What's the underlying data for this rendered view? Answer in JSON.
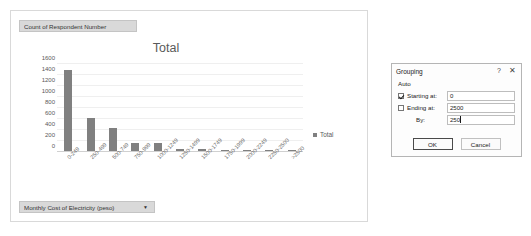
{
  "chart_panel": {
    "legend_field_button": {
      "label": "Count of Respondent Number",
      "arrow": ""
    },
    "axis_field_button": {
      "label": "Monthly Cost of Electricity (peso)",
      "arrow": "▼"
    },
    "legend": {
      "series_label": "Total",
      "swatch_color": "#808080"
    }
  },
  "chart_data": {
    "type": "bar",
    "title": "Total",
    "xlabel": "",
    "ylabel": "",
    "ylim": [
      0,
      1600
    ],
    "yticks": [
      0,
      200,
      400,
      600,
      800,
      1000,
      1200,
      1400,
      1600
    ],
    "grid": true,
    "legend_position": "right",
    "bar_color": "#808080",
    "categories": [
      "0-249",
      "250-499",
      "500-749",
      "750-999",
      "1000-1249",
      "1250-1499",
      "1500-1749",
      "1750-1999",
      "2000-2249",
      "2250-2500",
      ">2500"
    ],
    "series": [
      {
        "name": "Total",
        "values": [
          1480,
          600,
          420,
          140,
          140,
          30,
          28,
          10,
          15,
          6,
          12
        ]
      }
    ]
  },
  "dialog": {
    "title": "Grouping",
    "help_icon": "?",
    "close_icon": "✕",
    "section_label": "Auto",
    "fields": [
      {
        "name": "starting-at",
        "label": "Starting at:",
        "checked": true,
        "value": "0"
      },
      {
        "name": "ending-at",
        "label": "Ending at:",
        "checked": false,
        "value": "2500"
      },
      {
        "name": "by",
        "label": "By:",
        "checked": null,
        "value": "250"
      }
    ],
    "buttons": {
      "ok": "OK",
      "cancel": "Cancel"
    }
  }
}
